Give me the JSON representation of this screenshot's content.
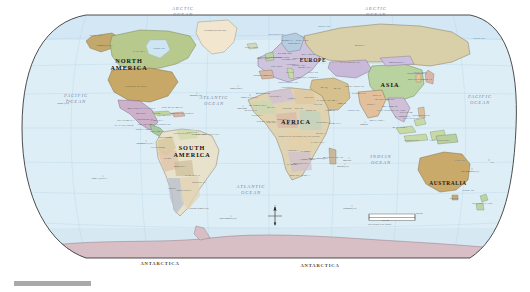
{
  "map": {
    "title": "Political World Map",
    "projection": "Robinson",
    "colors": {
      "ocean": "#dfeef6",
      "ocean_deep": "#cfe6f2",
      "page_background": "#ffffff",
      "border_line": "#3a3a3a",
      "graticule": "#9cc3d8",
      "antarctica": "#d8bfc6",
      "grey_bar": "#a9a9a9"
    },
    "grey_bar_label": ""
  },
  "oceans": [
    {
      "name": "ARCTIC OCEAN",
      "x": 183,
      "y": 12
    },
    {
      "name": "ARCTIC OCEAN",
      "x": 376,
      "y": 12
    },
    {
      "name": "PACIFIC OCEAN",
      "x": 76,
      "y": 99
    },
    {
      "name": "PACIFIC OCEAN",
      "x": 480,
      "y": 100
    },
    {
      "name": "ATLANTIC OCEAN",
      "x": 214,
      "y": 101
    },
    {
      "name": "ATLANTIC OCEAN",
      "x": 251,
      "y": 190
    },
    {
      "name": "INDIAN OCEAN",
      "x": 381,
      "y": 160
    }
  ],
  "continents": [
    {
      "name": "NORTH AMERICA",
      "x": 129,
      "y": 64,
      "size": "large"
    },
    {
      "name": "SOUTH AMERICA",
      "x": 192,
      "y": 151,
      "size": "large"
    },
    {
      "name": "EUROPE",
      "x": 313,
      "y": 60,
      "size": "normal"
    },
    {
      "name": "AFRICA",
      "x": 296,
      "y": 122,
      "size": "large"
    },
    {
      "name": "ASIA",
      "x": 390,
      "y": 85,
      "size": "large"
    },
    {
      "name": "AUSTRALIA",
      "x": 448,
      "y": 183,
      "size": "normal"
    },
    {
      "name": "ANTARCTICA",
      "x": 160,
      "y": 264,
      "size": "antarctica"
    },
    {
      "name": "ANTARCTICA",
      "x": 320,
      "y": 266,
      "size": "antarctica"
    }
  ],
  "countries": [
    {
      "name": "CANADA",
      "x": 139,
      "y": 51
    },
    {
      "name": "UNITED STATES",
      "x": 136,
      "y": 86
    },
    {
      "name": "Alaska (USA)",
      "x": 104,
      "y": 45
    },
    {
      "name": "Greenland (DENMARK)",
      "x": 215,
      "y": 30
    },
    {
      "name": "MEXICO",
      "x": 133,
      "y": 108
    },
    {
      "name": "GUATEMALA",
      "x": 126,
      "y": 120
    },
    {
      "name": "EL SALVADOR",
      "x": 124,
      "y": 125
    },
    {
      "name": "HONDURAS",
      "x": 145,
      "y": 119
    },
    {
      "name": "NICARAGUA",
      "x": 146,
      "y": 124
    },
    {
      "name": "COSTA RICA",
      "x": 144,
      "y": 129
    },
    {
      "name": "PANAMA",
      "x": 156,
      "y": 131
    },
    {
      "name": "CUBA",
      "x": 158,
      "y": 113
    },
    {
      "name": "JAMAICA",
      "x": 157,
      "y": 120
    },
    {
      "name": "HAITI",
      "x": 167,
      "y": 115
    },
    {
      "name": "DOMINICAN REPUBLIC",
      "x": 182,
      "y": 113
    },
    {
      "name": "THE BAHAMAS",
      "x": 172,
      "y": 107
    },
    {
      "name": "BELIZE",
      "x": 141,
      "y": 113
    },
    {
      "name": "COLOMBIA",
      "x": 166,
      "y": 137
    },
    {
      "name": "VENEZUELA",
      "x": 182,
      "y": 133
    },
    {
      "name": "GUYANA",
      "x": 193,
      "y": 132
    },
    {
      "name": "SURINAME",
      "x": 199,
      "y": 134
    },
    {
      "name": "FRENCH GUIANA",
      "x": 208,
      "y": 134
    },
    {
      "name": "ECUADOR",
      "x": 158,
      "y": 147
    },
    {
      "name": "PERU",
      "x": 168,
      "y": 158
    },
    {
      "name": "BRAZIL",
      "x": 202,
      "y": 156
    },
    {
      "name": "BOLIVIA",
      "x": 180,
      "y": 166
    },
    {
      "name": "PARAGUAY",
      "x": 193,
      "y": 175
    },
    {
      "name": "CHILE",
      "x": 172,
      "y": 188
    },
    {
      "name": "ARGENTINA",
      "x": 184,
      "y": 190
    },
    {
      "name": "URUGUAY",
      "x": 199,
      "y": 182
    },
    {
      "name": "Falkland Islands (UK)",
      "x": 199,
      "y": 208
    },
    {
      "name": "ICELAND",
      "x": 251,
      "y": 47
    },
    {
      "name": "NORWAY",
      "x": 287,
      "y": 40
    },
    {
      "name": "SWEDEN",
      "x": 294,
      "y": 43
    },
    {
      "name": "FINLAND",
      "x": 302,
      "y": 40
    },
    {
      "name": "UNITED KINGDOM",
      "x": 270,
      "y": 57
    },
    {
      "name": "IRELAND",
      "x": 263,
      "y": 58
    },
    {
      "name": "DENMARK",
      "x": 285,
      "y": 53
    },
    {
      "name": "NETHERLANDS",
      "x": 279,
      "y": 57
    },
    {
      "name": "GERMANY",
      "x": 289,
      "y": 59
    },
    {
      "name": "POLAND",
      "x": 299,
      "y": 58
    },
    {
      "name": "FRANCE",
      "x": 277,
      "y": 66
    },
    {
      "name": "SPAIN",
      "x": 268,
      "y": 75
    },
    {
      "name": "PORTUGAL",
      "x": 261,
      "y": 75
    },
    {
      "name": "ITALY",
      "x": 290,
      "y": 72
    },
    {
      "name": "AUSTRIA",
      "x": 292,
      "y": 64
    },
    {
      "name": "HUNGARY",
      "x": 299,
      "y": 65
    },
    {
      "name": "ROMANIA",
      "x": 305,
      "y": 67
    },
    {
      "name": "UKRAINE",
      "x": 312,
      "y": 61
    },
    {
      "name": "BELARUS",
      "x": 308,
      "y": 54
    },
    {
      "name": "GREECE",
      "x": 301,
      "y": 77
    },
    {
      "name": "TURKEY",
      "x": 313,
      "y": 77
    },
    {
      "name": "RUSSIA",
      "x": 360,
      "y": 45
    },
    {
      "name": "KAZAKHSTAN",
      "x": 350,
      "y": 62
    },
    {
      "name": "MONGOLIA",
      "x": 397,
      "y": 62
    },
    {
      "name": "CHINA",
      "x": 396,
      "y": 86
    },
    {
      "name": "JAPAN",
      "x": 428,
      "y": 79
    },
    {
      "name": "NORTH KOREA",
      "x": 417,
      "y": 73
    },
    {
      "name": "SOUTH KOREA",
      "x": 418,
      "y": 79
    },
    {
      "name": "INDIA",
      "x": 371,
      "y": 104
    },
    {
      "name": "PAKISTAN",
      "x": 359,
      "y": 93
    },
    {
      "name": "AFGHANISTAN",
      "x": 354,
      "y": 86
    },
    {
      "name": "IRAN",
      "x": 337,
      "y": 88
    },
    {
      "name": "IRAQ",
      "x": 324,
      "y": 87
    },
    {
      "name": "SAUDI ARABIA",
      "x": 327,
      "y": 100
    },
    {
      "name": "YEMEN",
      "x": 330,
      "y": 110
    },
    {
      "name": "OMAN",
      "x": 342,
      "y": 103
    },
    {
      "name": "EGYPT",
      "x": 309,
      "y": 97
    },
    {
      "name": "LIBYA",
      "x": 292,
      "y": 98
    },
    {
      "name": "ALGERIA",
      "x": 275,
      "y": 96
    },
    {
      "name": "MOROCCO",
      "x": 263,
      "y": 93
    },
    {
      "name": "TUNISIA",
      "x": 287,
      "y": 87
    },
    {
      "name": "MAURITANIA",
      "x": 258,
      "y": 105
    },
    {
      "name": "MALI",
      "x": 271,
      "y": 107
    },
    {
      "name": "NIGER",
      "x": 287,
      "y": 108
    },
    {
      "name": "CHAD",
      "x": 299,
      "y": 108
    },
    {
      "name": "SUDAN",
      "x": 311,
      "y": 110
    },
    {
      "name": "ETHIOPIA",
      "x": 323,
      "y": 122
    },
    {
      "name": "SOMALIA",
      "x": 335,
      "y": 123
    },
    {
      "name": "KENYA",
      "x": 321,
      "y": 133
    },
    {
      "name": "NIGERIA",
      "x": 283,
      "y": 119
    },
    {
      "name": "CAMEROON",
      "x": 291,
      "y": 124
    },
    {
      "name": "GHANA",
      "x": 272,
      "y": 122
    },
    {
      "name": "SENEGAL",
      "x": 251,
      "y": 110
    },
    {
      "name": "GUINEA",
      "x": 257,
      "y": 115
    },
    {
      "name": "IVORY COAST",
      "x": 266,
      "y": 121
    },
    {
      "name": "DEMOCRATIC REPUBLIC OF THE CONGO",
      "x": 299,
      "y": 136
    },
    {
      "name": "ANGOLA",
      "x": 293,
      "y": 150
    },
    {
      "name": "ZAMBIA",
      "x": 306,
      "y": 151
    },
    {
      "name": "TANZANIA",
      "x": 318,
      "y": 142
    },
    {
      "name": "MOZAMBIQUE",
      "x": 318,
      "y": 158
    },
    {
      "name": "ZIMBABWE",
      "x": 308,
      "y": 159
    },
    {
      "name": "BOTSWANA",
      "x": 301,
      "y": 163
    },
    {
      "name": "NAMIBIA",
      "x": 293,
      "y": 164
    },
    {
      "name": "SOUTH AFRICA",
      "x": 300,
      "y": 175
    },
    {
      "name": "MADAGASCAR",
      "x": 333,
      "y": 157
    },
    {
      "name": "THAILAND",
      "x": 398,
      "y": 110
    },
    {
      "name": "VIETNAM",
      "x": 406,
      "y": 112
    },
    {
      "name": "MYANMAR",
      "x": 390,
      "y": 106
    },
    {
      "name": "CAMBODIA",
      "x": 403,
      "y": 116
    },
    {
      "name": "MALAYSIA",
      "x": 400,
      "y": 127
    },
    {
      "name": "INDONESIA",
      "x": 412,
      "y": 140
    },
    {
      "name": "PHILIPPINES",
      "x": 421,
      "y": 115
    },
    {
      "name": "PAPUA NEW GUINEA",
      "x": 440,
      "y": 140
    },
    {
      "name": "NEW ZEALAND",
      "x": 482,
      "y": 203
    },
    {
      "name": "SRI LANKA",
      "x": 377,
      "y": 120
    },
    {
      "name": "NEPAL",
      "x": 377,
      "y": 95
    },
    {
      "name": "BANGLADESH",
      "x": 385,
      "y": 99
    }
  ],
  "seas": [
    {
      "name": "Bering Sea",
      "x": 479,
      "y": 38
    },
    {
      "name": "Gulf of Mexico",
      "x": 147,
      "y": 108
    },
    {
      "name": "Caribbean Sea",
      "x": 163,
      "y": 124
    },
    {
      "name": "Mediterranean Sea",
      "x": 288,
      "y": 82
    },
    {
      "name": "Black Sea",
      "x": 313,
      "y": 72
    },
    {
      "name": "Red Sea",
      "x": 318,
      "y": 104
    },
    {
      "name": "Arabian Sea",
      "x": 353,
      "y": 110
    },
    {
      "name": "Bay of Bengal",
      "x": 384,
      "y": 110
    },
    {
      "name": "South China Sea",
      "x": 411,
      "y": 118
    },
    {
      "name": "Coral Sea",
      "x": 460,
      "y": 160
    },
    {
      "name": "Tasman Sea",
      "x": 468,
      "y": 190
    },
    {
      "name": "Hudson Bay",
      "x": 159,
      "y": 48
    },
    {
      "name": "Bering Strait",
      "x": 96,
      "y": 35
    },
    {
      "name": "Sea of Japan",
      "x": 420,
      "y": 72
    },
    {
      "name": "Barents Sea",
      "x": 324,
      "y": 26
    },
    {
      "name": "Norwegian Sea",
      "x": 276,
      "y": 34
    },
    {
      "name": "Tasmania",
      "x": 454,
      "y": 198
    }
  ],
  "islands": [
    {
      "name": "Hawaii (USA)",
      "x": 63,
      "y": 103
    },
    {
      "name": "Bermuda (UK)",
      "x": 196,
      "y": 95
    },
    {
      "name": "Azores (PORT.)",
      "x": 236,
      "y": 88
    },
    {
      "name": "Canary Is. (SPAIN)",
      "x": 249,
      "y": 97
    },
    {
      "name": "Cape Verde",
      "x": 242,
      "y": 108
    },
    {
      "name": "Galapagos Is. (EC.)",
      "x": 145,
      "y": 143
    },
    {
      "name": "Easter I. (CHILE)",
      "x": 99,
      "y": 178
    },
    {
      "name": "Fiji",
      "x": 492,
      "y": 162
    },
    {
      "name": "New Caledonia (FR.)",
      "x": 470,
      "y": 171
    },
    {
      "name": "Reunion (FR.)",
      "x": 343,
      "y": 166
    },
    {
      "name": "Mauritius",
      "x": 347,
      "y": 160
    },
    {
      "name": "Maldives",
      "x": 364,
      "y": 124
    },
    {
      "name": "South Georgia (UK)",
      "x": 228,
      "y": 218
    },
    {
      "name": "Kerguelen (FR.)",
      "x": 350,
      "y": 208
    }
  ],
  "compass": {
    "label_n": "N",
    "label_s": "S",
    "label_e": "E",
    "label_w": "W",
    "name": "compass-rose"
  },
  "scale": {
    "top_label": "2000 mi",
    "bottom_label": "2000 km",
    "note": "Scale accurate at the Equator",
    "zero": "0"
  }
}
